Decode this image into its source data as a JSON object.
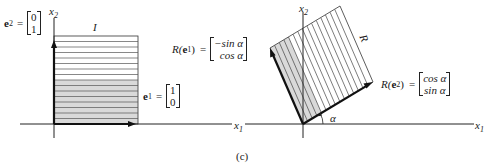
{
  "figure": {
    "caption": "(c)",
    "left_panel": {
      "region_label": "I",
      "axis_x_label": "x",
      "axis_x_sub": "1",
      "axis_y_label": "x",
      "axis_y_sub": "2",
      "e1": {
        "name": "e",
        "sub": "1",
        "eq": "=",
        "components": [
          "1",
          "0"
        ]
      },
      "e2": {
        "name": "e",
        "sub": "2",
        "eq": "=",
        "components": [
          "0",
          "1"
        ]
      }
    },
    "right_panel": {
      "region_label": "R",
      "axis_x_label": "x",
      "axis_x_sub": "1",
      "axis_y_label": "x",
      "axis_y_sub": "2",
      "angle_label": "α",
      "R_e1": {
        "prefix": "R(",
        "name": "e",
        "sub": "1",
        "suffix": ")",
        "eq": "=",
        "components": [
          "−sin α",
          "cos α"
        ]
      },
      "R_e2": {
        "prefix": "R(",
        "name": "e",
        "sub": "2",
        "suffix": ")",
        "eq": "=",
        "components": [
          "cos α",
          "sin α"
        ]
      }
    },
    "colors": {
      "ink": "#1a1a1a",
      "shade": "#d9d9d9",
      "hatch": "#444444"
    }
  }
}
